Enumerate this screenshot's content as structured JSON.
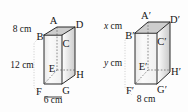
{
  "figure": {
    "caption": "",
    "background_color": "#fdfdfd",
    "edge_color": "#2b2b2b",
    "hidden_edge_color": "#6e6e6e",
    "top_face_fill": "#cfcfcf",
    "front_face_fill": "#f3f3f3",
    "side_face_fill": "#e0e0e0"
  },
  "cuboids": [
    {
      "id": "left-cuboid",
      "name": "cuboid-abcdefgh",
      "vertices": {
        "top_back_left": "A",
        "top_front_left": "B",
        "top_front_right": "C",
        "top_back_right": "D",
        "bottom_front_left_inner": "E",
        "bottom_front_left": "F",
        "bottom_front_right": "G",
        "bottom_back_right": "H"
      },
      "dimensions": [
        {
          "id": "depth",
          "value": "8 cm",
          "position": "upper-left"
        },
        {
          "id": "height",
          "value": "12 cm",
          "position": "left"
        },
        {
          "id": "width",
          "value": "6 cm",
          "position": "bottom"
        }
      ]
    },
    {
      "id": "right-cuboid",
      "name": "cuboid-abcdefgh-prime",
      "vertices": {
        "top_back_left": "A′",
        "top_front_left": "B′",
        "top_front_right": "C′",
        "top_back_right": "D′",
        "bottom_front_left_inner": "E′",
        "bottom_front_left": "F′",
        "bottom_front_right": "G′",
        "bottom_back_right": "H′"
      },
      "dimensions": [
        {
          "id": "depth",
          "value_italic": "x",
          "value_unit": " cm",
          "value": "x cm",
          "position": "upper-left"
        },
        {
          "id": "height",
          "value_italic": "y",
          "value_unit": " cm",
          "value": "y cm",
          "position": "left"
        },
        {
          "id": "width",
          "value": "8 cm",
          "position": "bottom"
        }
      ]
    }
  ],
  "labels": {
    "left": {
      "A": "A",
      "B": "B",
      "C": "C",
      "D": "D",
      "E": "E",
      "F": "F",
      "G": "G",
      "H": "H",
      "depth": "8 cm",
      "height": "12 cm",
      "width": "6 cm"
    },
    "right": {
      "A": "A′",
      "B": "B′",
      "C": "C′",
      "D": "D′",
      "E": "E′",
      "F": "F′",
      "G": "G′",
      "H": "H′",
      "depth_var": "x",
      "depth_unit": " cm",
      "height_var": "y",
      "height_unit": " cm",
      "width": "8 cm"
    }
  }
}
